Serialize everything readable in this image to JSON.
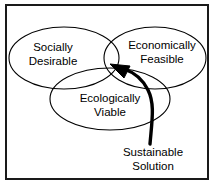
{
  "diagram": {
    "frame": {
      "border_color": "#1a1a1a",
      "background": "#ffffff"
    },
    "stroke_color": "#000000",
    "circles": [
      {
        "name": "socially-desirable",
        "label_line1": "Socially",
        "label_line2": "Desirable",
        "cx": 64,
        "cy": 58,
        "rx": 55,
        "ry": 31
      },
      {
        "name": "economically-feasible",
        "label_line1": "Economically",
        "label_line2": "Feasible",
        "cx": 155,
        "cy": 58,
        "rx": 51,
        "ry": 31
      },
      {
        "name": "ecologically-viable",
        "label_line1": "Ecologically",
        "label_line2": "Viable",
        "cx": 110,
        "cy": 99,
        "rx": 60,
        "ry": 31
      }
    ],
    "annotation": {
      "name": "sustainable-solution",
      "label_line1": "Sustainable",
      "label_line2": "Solution",
      "arrow_target_x": 115,
      "arrow_target_y": 66,
      "arrow_tail_x": 150,
      "arrow_tail_y": 143
    }
  }
}
